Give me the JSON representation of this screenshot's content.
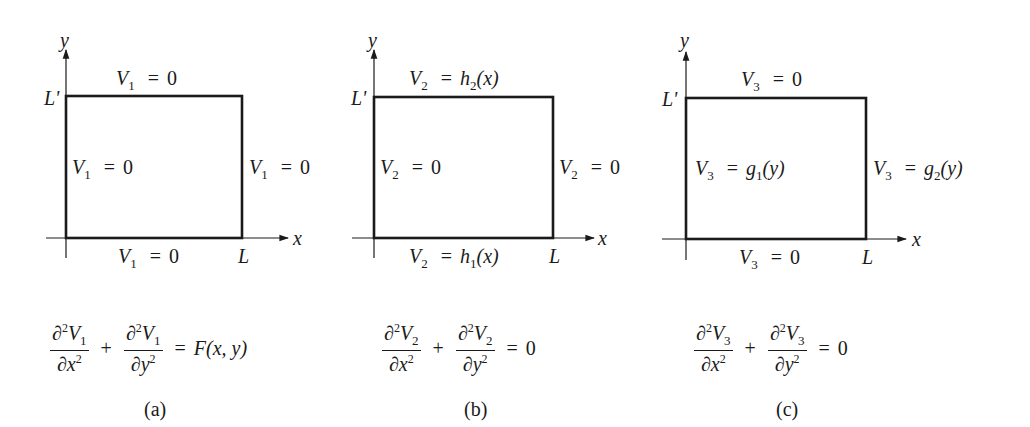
{
  "figure": {
    "panels": [
      {
        "id": "a",
        "caption": "(a)",
        "axis_y": "y",
        "axis_x": "x",
        "corner_y": "L'",
        "corner_x": "L",
        "boundary": {
          "top": {
            "var": "V",
            "sub": "1",
            "rhs": "0"
          },
          "left": {
            "var": "V",
            "sub": "1",
            "rhs": "0"
          },
          "right": {
            "var": "V",
            "sub": "1",
            "rhs": "0"
          },
          "bottom": {
            "var": "V",
            "sub": "1",
            "rhs": "0"
          }
        },
        "equation": {
          "term1_num": "∂",
          "term1_num_var": "V",
          "term1_sub": "1",
          "term1_den": "∂x",
          "term2_num": "∂",
          "term2_num_var": "V",
          "term2_sub": "1",
          "term2_den": "∂y",
          "power": "2",
          "plus": "+",
          "equals": "=",
          "rhs": "F(x, y)"
        }
      },
      {
        "id": "b",
        "caption": "(b)",
        "axis_y": "y",
        "axis_x": "x",
        "corner_y": "L'",
        "corner_x": "L",
        "boundary": {
          "top": {
            "var": "V",
            "sub": "2",
            "rhs_fn": "h",
            "rhs_sub": "2",
            "rhs_arg": "(x)"
          },
          "left": {
            "var": "V",
            "sub": "2",
            "rhs": "0"
          },
          "right": {
            "var": "V",
            "sub": "2",
            "rhs": "0"
          },
          "bottom": {
            "var": "V",
            "sub": "2",
            "rhs_fn": "h",
            "rhs_sub": "1",
            "rhs_arg": "(x)"
          }
        },
        "equation": {
          "term1_num": "∂",
          "term1_num_var": "V",
          "term1_sub": "2",
          "term1_den": "∂x",
          "term2_num": "∂",
          "term2_num_var": "V",
          "term2_sub": "2",
          "term2_den": "∂y",
          "power": "2",
          "plus": "+",
          "equals": "=",
          "rhs": "0"
        }
      },
      {
        "id": "c",
        "caption": "(c)",
        "axis_y": "y",
        "axis_x": "x",
        "corner_y": "L'",
        "corner_x": "L",
        "boundary": {
          "top": {
            "var": "V",
            "sub": "3",
            "rhs": "0"
          },
          "left": {
            "var": "V",
            "sub": "3",
            "rhs_fn": "g",
            "rhs_sub": "1",
            "rhs_arg": "(y)"
          },
          "right": {
            "var": "V",
            "sub": "3",
            "rhs_fn": "g",
            "rhs_sub": "2",
            "rhs_arg": "(y)"
          },
          "bottom": {
            "var": "V",
            "sub": "3",
            "rhs": "0"
          }
        },
        "equation": {
          "term1_num": "∂",
          "term1_num_var": "V",
          "term1_sub": "3",
          "term1_den": "∂x",
          "term2_num": "∂",
          "term2_num_var": "V",
          "term2_sub": "3",
          "term2_den": "∂y",
          "power": "2",
          "plus": "+",
          "equals": "=",
          "rhs": "0"
        }
      }
    ],
    "equals_sign": "="
  },
  "colors": {
    "ink": "#1a1a1a",
    "background": "#ffffff"
  }
}
